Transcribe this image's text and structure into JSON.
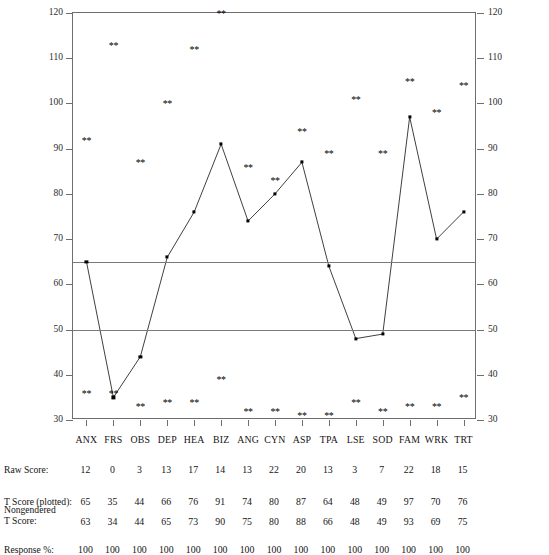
{
  "chart_data": {
    "type": "line",
    "title": "",
    "xlabel": "",
    "ylabel": "",
    "ylim": [
      30,
      120
    ],
    "yticks": [
      30,
      40,
      50,
      60,
      70,
      80,
      90,
      100,
      110,
      120
    ],
    "grid": false,
    "legend": "none",
    "reference_lines": [
      65,
      50
    ],
    "categories": [
      "ANX",
      "FRS",
      "OBS",
      "DEP",
      "HEA",
      "BIZ",
      "ANG",
      "CYN",
      "ASP",
      "TPA",
      "LSE",
      "SOD",
      "FAM",
      "WRK",
      "TRT"
    ],
    "series": [
      {
        "name": "T Score (plotted)",
        "values": [
          65,
          35,
          44,
          66,
          76,
          91,
          74,
          80,
          87,
          64,
          48,
          49,
          97,
          70,
          76
        ]
      },
      {
        "name": "Upper confidence marker",
        "marker": "**",
        "values": [
          92,
          113,
          87,
          100,
          112,
          120,
          86,
          83,
          94,
          89,
          101,
          89,
          105,
          98,
          104
        ]
      },
      {
        "name": "Lower confidence marker",
        "marker": "**",
        "values": [
          36,
          36,
          33,
          34,
          34,
          39,
          32,
          32,
          31,
          31,
          34,
          32,
          33,
          33,
          35
        ]
      }
    ]
  },
  "axis": {
    "left_ticks": [
      "120",
      "110",
      "100",
      "90",
      "80",
      "70",
      "60",
      "50",
      "40",
      "30"
    ],
    "right_ticks": [
      "120",
      "110",
      "100",
      "90",
      "80",
      "70",
      "60",
      "50",
      "40",
      "30"
    ]
  },
  "table": {
    "rows": [
      {
        "label": "Raw Score:",
        "values": [
          "12",
          "0",
          "3",
          "13",
          "17",
          "14",
          "13",
          "22",
          "20",
          "13",
          "3",
          "7",
          "22",
          "18",
          "15"
        ]
      },
      {
        "label": "T Score (plotted):",
        "values": [
          "65",
          "35",
          "44",
          "66",
          "76",
          "91",
          "74",
          "80",
          "87",
          "64",
          "48",
          "49",
          "97",
          "70",
          "76"
        ]
      },
      {
        "label": "Nongendered\nT Score:",
        "label_line1": "Nongendered",
        "label_line2": "T Score:",
        "values": [
          "63",
          "34",
          "44",
          "65",
          "73",
          "90",
          "75",
          "80",
          "88",
          "66",
          "48",
          "49",
          "93",
          "69",
          "75"
        ]
      },
      {
        "label": "Response %:",
        "values": [
          "100",
          "100",
          "100",
          "100",
          "100",
          "100",
          "100",
          "100",
          "100",
          "100",
          "100",
          "100",
          "100",
          "100",
          "100"
        ]
      }
    ]
  }
}
